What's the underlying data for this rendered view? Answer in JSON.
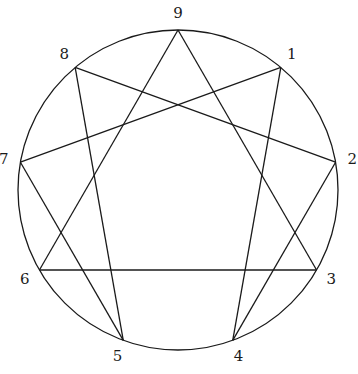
{
  "diagram": {
    "type": "enneagram",
    "points": [
      {
        "label": "9",
        "angle_deg": -90
      },
      {
        "label": "1",
        "angle_deg": -50
      },
      {
        "label": "2",
        "angle_deg": -10
      },
      {
        "label": "3",
        "angle_deg": 30
      },
      {
        "label": "4",
        "angle_deg": 70
      },
      {
        "label": "5",
        "angle_deg": 110
      },
      {
        "label": "6",
        "angle_deg": 150
      },
      {
        "label": "7",
        "angle_deg": 190
      },
      {
        "label": "8",
        "angle_deg": 230
      }
    ],
    "connections": [
      [
        "9",
        "3"
      ],
      [
        "3",
        "6"
      ],
      [
        "6",
        "9"
      ],
      [
        "1",
        "4"
      ],
      [
        "4",
        "2"
      ],
      [
        "2",
        "8"
      ],
      [
        "8",
        "5"
      ],
      [
        "5",
        "7"
      ],
      [
        "7",
        "1"
      ]
    ]
  }
}
